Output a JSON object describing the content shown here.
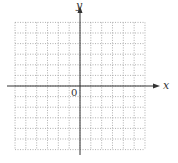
{
  "chart_data": {
    "type": "scatter",
    "title": "",
    "xlabel": "x",
    "ylabel": "y",
    "origin_label": "0",
    "grid": true,
    "grid_style": "dotted",
    "grid_cells": {
      "left": 6,
      "right": 6,
      "up": 6,
      "down": 6
    },
    "xlim": [
      -6,
      6
    ],
    "ylim": [
      -6,
      6
    ],
    "series": [],
    "tick_labels": []
  },
  "colors": {
    "axis": "#333333",
    "grid": "#999999",
    "background": "#ffffff"
  }
}
